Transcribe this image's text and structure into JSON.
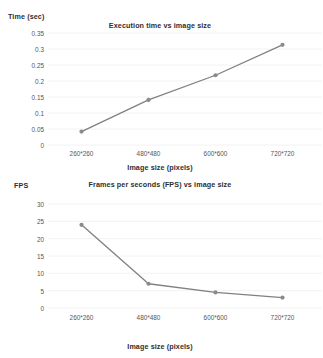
{
  "chart_data": [
    {
      "id": "execution-time",
      "type": "line",
      "title": "Execution time vs image size",
      "xlabel": "Image size (pixels)",
      "ylabel": "Time (sec)",
      "categories": [
        "260*260",
        "480*480",
        "600*600",
        "720*720"
      ],
      "values": [
        0.042,
        0.141,
        0.218,
        0.313
      ],
      "ylim": [
        0,
        0.35
      ],
      "yticks": [
        "0",
        "0.05",
        "0.1",
        "0.15",
        "0.2",
        "0.25",
        "0.3",
        "0.35"
      ],
      "ytick_values": [
        0,
        0.05,
        0.1,
        0.15,
        0.2,
        0.25,
        0.3,
        0.35
      ],
      "grid": true,
      "legend": "none",
      "series_color": "#808080",
      "marker_color": "#8a8a8a",
      "grid_color": "#f2f2f2"
    },
    {
      "id": "frames-per-second",
      "type": "line",
      "title": "Frames per seconds (FPS) vs image size",
      "xlabel": "Image size (pixels)",
      "ylabel": "FPS",
      "categories": [
        "260*260",
        "480*480",
        "600*600",
        "720*720"
      ],
      "values": [
        24,
        7,
        4.5,
        3
      ],
      "ylim": [
        0,
        30
      ],
      "yticks": [
        "0",
        "5",
        "10",
        "15",
        "20",
        "25",
        "30"
      ],
      "ytick_values": [
        0,
        5,
        10,
        15,
        20,
        25,
        30
      ],
      "grid": true,
      "legend": "none",
      "series_color": "#808080",
      "marker_color": "#8a8a8a",
      "grid_color": "#f2f2f2"
    }
  ]
}
